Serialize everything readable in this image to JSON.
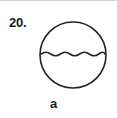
{
  "figure": {
    "problem_number": "20.",
    "caption": "a",
    "diagram": {
      "name": "circle-with-water-level",
      "shape": "circle",
      "stroke_color": "#222222",
      "fill_color": "#ffffff",
      "panel_background": "#ffffff",
      "panel_border_color": "#d6d6d6",
      "water_line": {
        "name": "wavy-water-line",
        "style": "wavy",
        "wave_count": 6,
        "position": "upper-third",
        "stroke_color": "#222222"
      }
    }
  }
}
